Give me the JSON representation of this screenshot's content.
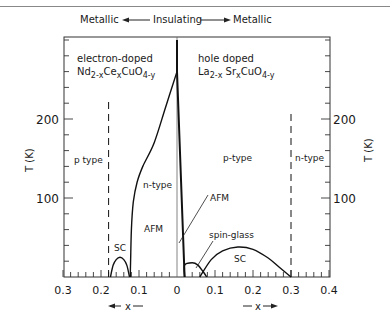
{
  "chart_data": {
    "type": "line",
    "title": "",
    "header": {
      "left": "Metallic",
      "center": "Insulating",
      "right": "Metallic"
    },
    "ylabel": "T (K)",
    "ylabel_right": "T (K)",
    "ylim": [
      0,
      304
    ],
    "yticks_major": [
      100,
      200
    ],
    "yticks_minor_step": 20,
    "xlim_left": [
      0.3,
      0
    ],
    "xlim_right": [
      0,
      0.4
    ],
    "xtick_labels_left": [
      "0.3",
      "0.2",
      "0.1",
      "0"
    ],
    "xtick_labels_right": [
      "0.1",
      "0.2",
      "0.3",
      "0.4"
    ],
    "xticks_minor_step": 0.02,
    "xlabel_left": "x",
    "xlabel_right": "x",
    "panels": {
      "left": {
        "title": "electron-doped",
        "formula": {
          "base": "Nd",
          "sub1": "2-x",
          "mid": "Ce",
          "sub2": "x",
          "mid2": "CuO",
          "sub3": "4-y"
        },
        "regions": [
          "p type",
          "n-type",
          "AFM",
          "SC"
        ]
      },
      "right": {
        "title": "hole doped",
        "formula": {
          "base": "La",
          "sub1": "2-x",
          "mid": " Sr",
          "sub2": "x",
          "mid2": "CuO",
          "sub3": "4-y"
        },
        "regions": [
          "p-type",
          "n-type",
          "AFM",
          "spin-glass",
          "SC"
        ]
      }
    },
    "series": [
      {
        "name": "AFM boundary (electron-doped)",
        "side": "left",
        "style": "solid",
        "points": [
          [
            0.0,
            260
          ],
          [
            0.03,
            215
          ],
          [
            0.06,
            170
          ],
          [
            0.09,
            140
          ],
          [
            0.105,
            120
          ],
          [
            0.115,
            95
          ],
          [
            0.12,
            60
          ],
          [
            0.122,
            20
          ],
          [
            0.123,
            0
          ]
        ]
      },
      {
        "name": "SC dome (electron-doped)",
        "side": "left",
        "style": "solid",
        "points": [
          [
            0.175,
            0
          ],
          [
            0.168,
            15
          ],
          [
            0.16,
            22
          ],
          [
            0.15,
            25
          ],
          [
            0.14,
            22
          ],
          [
            0.132,
            15
          ],
          [
            0.125,
            0
          ]
        ]
      },
      {
        "name": "p/n boundary (electron-doped)",
        "side": "left",
        "style": "dashed",
        "points": [
          [
            0.18,
            0
          ],
          [
            0.18,
            225
          ]
        ]
      },
      {
        "name": "AFM boundary (hole-doped)",
        "side": "right",
        "style": "solid",
        "points": [
          [
            0.0,
            300
          ],
          [
            0.0,
            260
          ],
          [
            0.02,
            0
          ]
        ]
      },
      {
        "name": "spin-glass dome",
        "side": "right",
        "style": "solid",
        "points": [
          [
            0.02,
            0
          ],
          [
            0.02,
            15
          ],
          [
            0.04,
            18
          ],
          [
            0.055,
            15
          ],
          [
            0.07,
            6
          ],
          [
            0.078,
            0
          ]
        ]
      },
      {
        "name": "SC dome (hole-doped)",
        "side": "right",
        "style": "solid",
        "points": [
          [
            0.06,
            0
          ],
          [
            0.09,
            22
          ],
          [
            0.12,
            33
          ],
          [
            0.16,
            38
          ],
          [
            0.2,
            35
          ],
          [
            0.24,
            24
          ],
          [
            0.27,
            12
          ],
          [
            0.3,
            0
          ]
        ]
      },
      {
        "name": "p/n boundary (hole-doped)",
        "side": "right",
        "style": "dashed",
        "points": [
          [
            0.3,
            0
          ],
          [
            0.3,
            210
          ]
        ]
      }
    ],
    "annotations": [
      {
        "text": "AFM",
        "side": "right",
        "arrow_to": [
          0.005,
          40
        ]
      },
      {
        "text": "spin-glass",
        "side": "right",
        "arrow_to": [
          0.045,
          8
        ]
      }
    ],
    "grid": false,
    "legend": "none"
  }
}
